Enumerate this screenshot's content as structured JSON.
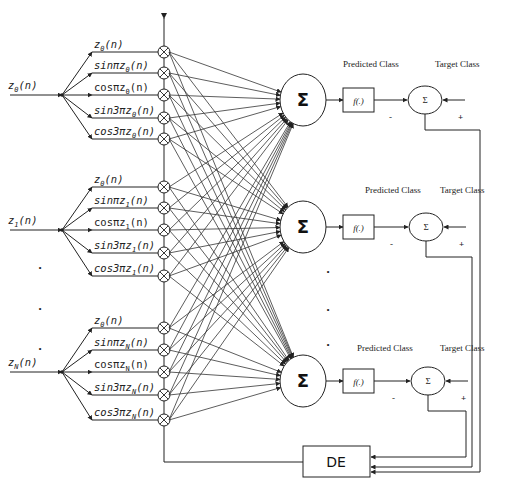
{
  "diagram": {
    "colors": {
      "stroke": "#222222",
      "background": "#ffffff"
    },
    "inputs": [
      {
        "label": "z_0(n)",
        "text": "z",
        "sub": "0",
        "suffix": "(n)"
      },
      {
        "label": "z_1(n)",
        "text": "z",
        "sub": "1",
        "suffix": "(n)"
      },
      {
        "label": "z_N(n)",
        "text": "z",
        "sub": "N",
        "suffix": "(n)"
      }
    ],
    "expansions": [
      [
        "z_0(n)",
        "sinπz_0(n)",
        "cosπz_0(n)",
        "sin3πz_0(n)",
        "cos3πz_0(n)"
      ],
      [
        "z_0(n)",
        "sinπz_1(n)",
        "cosπz_1(n)",
        "sin3πz_1(n)",
        "cos3πz_1(n)"
      ],
      [
        "z_0(n)",
        "sinπz_N(n)",
        "cosπz_N(n)",
        "sin3πz_N(n)",
        "cos3πz_N(n)"
      ]
    ],
    "multiplier_symbol": "⊗",
    "sum_symbol": "Σ",
    "activation_label": "f(.)",
    "error_sum_symbol": "Σ",
    "predicted_label": "Predicted Class",
    "target_label": "Target Class",
    "minus_sign": "-",
    "plus_sign": "+",
    "ellipsis_dot": "•",
    "optimizer_label": "DE"
  }
}
